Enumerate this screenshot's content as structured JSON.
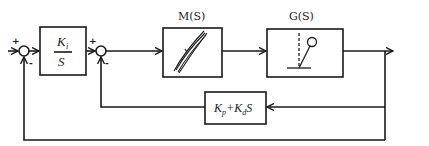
{
  "diagram": {
    "type": "control-system-block-diagram",
    "blocks": {
      "integrator": {
        "numerator": "K",
        "numerator_sub": "i",
        "denominator": "S"
      },
      "actuator": {
        "label": "M(S)",
        "icon": "hysteresis-loop-icon"
      },
      "plant": {
        "label": "G(S)",
        "icon": "pendulum-icon"
      },
      "feedback": {
        "term1": "K",
        "term1_sub": "p",
        "plus": "+",
        "term2": "K",
        "term2_sub": "d",
        "term2_suffix": "S"
      }
    },
    "junctions": {
      "outer": {
        "plus": "+",
        "minus": "-"
      },
      "inner": {
        "plus": "+",
        "minus": "-"
      }
    }
  }
}
